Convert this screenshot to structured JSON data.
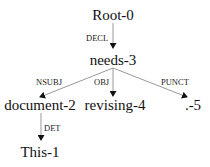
{
  "diagram": {
    "type": "dependency-tree",
    "nodes": {
      "root": "Root-0",
      "needs": "needs-3",
      "document": "document-2",
      "revising": "revising-4",
      "punct": ".-5",
      "this": "This-1"
    },
    "edges": {
      "decl": "DECL",
      "nsubj": "NSUBJ",
      "obj": "OBJ",
      "punct": "PUNCT",
      "det": "DET"
    },
    "colors": {
      "line": "#999999",
      "arrow": "#111111",
      "text": "#111111"
    }
  }
}
